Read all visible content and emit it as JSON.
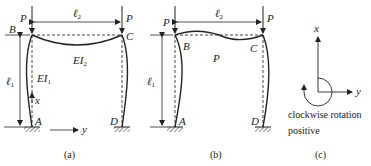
{
  "figure": {
    "panels": [
      {
        "id": "a",
        "caption": "(a)",
        "load_left": "P",
        "load_right": "P",
        "span_label": "ℓ",
        "span_sub": "2",
        "height_label": "ℓ",
        "height_sub": "1",
        "beam_stiffness": "EI",
        "beam_stiffness_sub": "2",
        "column_stiffness": "EI",
        "column_stiffness_sub": "1",
        "nodes": {
          "top_left": "B",
          "top_right": "C",
          "base_left": "A",
          "base_right": "D"
        },
        "axis_x": "x",
        "axis_y": "y"
      },
      {
        "id": "b",
        "caption": "(b)",
        "load_left": "P",
        "load_right": "P",
        "span_label": "ℓ",
        "span_sub": "2",
        "height_label": "ℓ",
        "height_sub": "1",
        "center_label": "P",
        "nodes": {
          "top_left": "B",
          "top_right": "C",
          "base_left": "A",
          "base_right": "D"
        }
      },
      {
        "id": "c",
        "caption": "(c)",
        "axis_x": "x",
        "axis_y": "y",
        "note_line1": "clockwise rotation",
        "note_line2": "positive"
      }
    ],
    "colors": {
      "stroke": "#222222",
      "dashed": "#444444",
      "background": "#ffffff"
    }
  }
}
